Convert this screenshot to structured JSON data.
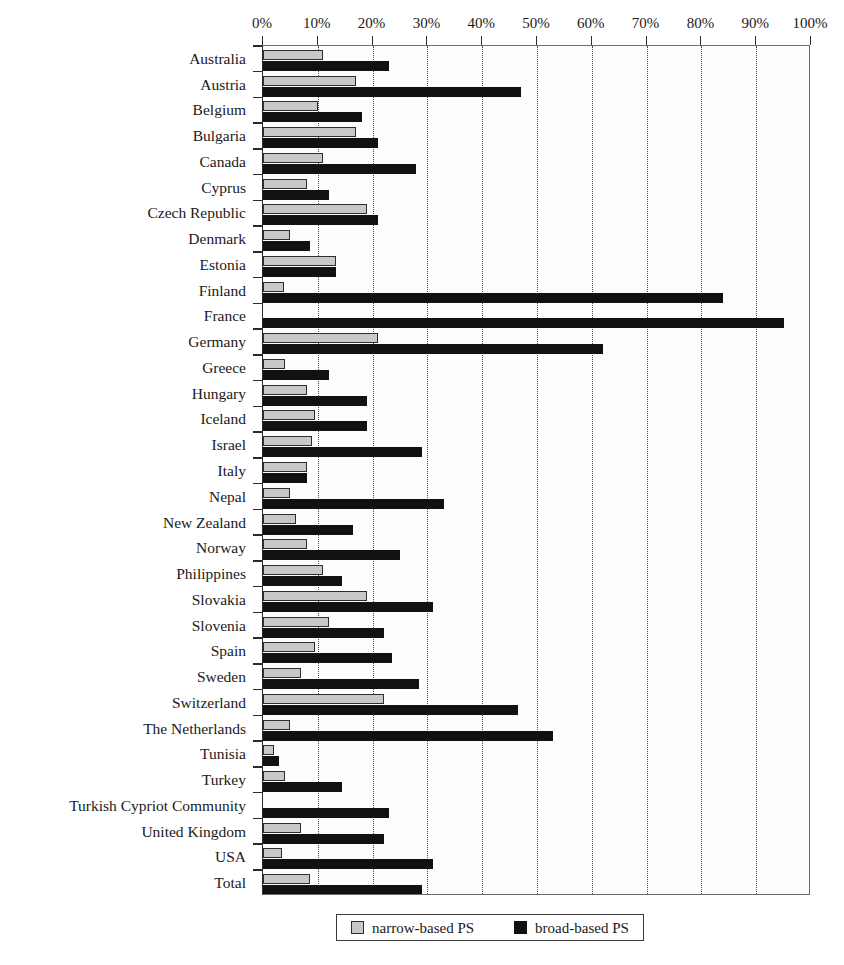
{
  "chart_data": {
    "type": "bar",
    "orientation": "horizontal",
    "title": "",
    "xlabel": "",
    "ylabel": "",
    "xlim": [
      0,
      100
    ],
    "xticks": [
      "0%",
      "10%",
      "20%",
      "30%",
      "40%",
      "50%",
      "60%",
      "70%",
      "80%",
      "90%",
      "100%"
    ],
    "xtick_values": [
      0,
      10,
      20,
      30,
      40,
      50,
      60,
      70,
      80,
      90,
      100
    ],
    "grid": true,
    "grid_axis": "x",
    "grid_style": "dotted",
    "legend_position": "bottom-center",
    "categories": [
      "Australia",
      "Austria",
      "Belgium",
      "Bulgaria",
      "Canada",
      "Cyprus",
      "Czech Republic",
      "Denmark",
      "Estonia",
      "Finland",
      "France",
      "Germany",
      "Greece",
      "Hungary",
      "Iceland",
      "Israel",
      "Italy",
      "Nepal",
      "New Zealand",
      "Norway",
      "Philippines",
      "Slovakia",
      "Slovenia",
      "Spain",
      "Sweden",
      "Switzerland",
      "The Netherlands",
      "Tunisia",
      "Turkey",
      "Turkish Cypriot Community",
      "United Kingdom",
      "USA",
      "Total"
    ],
    "series": [
      {
        "name": "narrow-based PS",
        "color": "#c8c8c8",
        "values": [
          11,
          17,
          10,
          17,
          11,
          8,
          19,
          5,
          13.3,
          3.8,
          0,
          21,
          4,
          8,
          9.5,
          9,
          8,
          5,
          6,
          8,
          11,
          19,
          12,
          9.5,
          7,
          22,
          5,
          2,
          4,
          0,
          7,
          3.5,
          8.5
        ]
      },
      {
        "name": "broad-based PS",
        "color": "#111111",
        "values": [
          23,
          47,
          18,
          21,
          28,
          12,
          21,
          8.5,
          13.3,
          84,
          95,
          62,
          12,
          19,
          19,
          29,
          8,
          33,
          16.5,
          25,
          14.5,
          31,
          22,
          23.5,
          28.5,
          46.5,
          53,
          3,
          14.5,
          23,
          22,
          31,
          29
        ]
      }
    ]
  },
  "legend": {
    "items": [
      {
        "label": "narrow-based PS",
        "swatch": "narrow"
      },
      {
        "label": "broad-based PS",
        "swatch": "broad"
      }
    ]
  }
}
